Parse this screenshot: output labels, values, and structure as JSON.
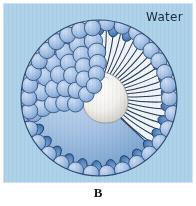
{
  "figure": {
    "caption": "B",
    "panel": {
      "background_color": "#aed2ea",
      "border_color": "#cfe4f3"
    },
    "labels": {
      "water": "Water"
    },
    "diagram": {
      "type": "cut-away micelle / lipid sphere in water",
      "center_x": 95,
      "center_y": 94,
      "radius": 78,
      "head_group_color": "#9fbde2",
      "head_group_highlight": "#c3d8f0",
      "head_group_outline": "#2f4f79",
      "cut_edge_head_color": "#5a8cc4",
      "cut_edge_head_outline": "#22406b",
      "interior_color": "#eef5fb",
      "tail_line_color": "#2b3a4d",
      "core_color": "#f2f2f0",
      "core_outline": "#8a8d88",
      "sphere_shadow_color": "#7ea7cf",
      "tail_count": 42,
      "surface_head_count": 96,
      "cut_edge_head_count": 22
    }
  }
}
